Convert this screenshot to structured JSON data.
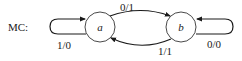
{
  "diagram": {
    "type": "state-machine",
    "title": "MC:",
    "states": [
      {
        "id": "a",
        "label": "a"
      },
      {
        "id": "b",
        "label": "b"
      }
    ],
    "transitions": [
      {
        "from": "a",
        "to": "a",
        "label": "1/0"
      },
      {
        "from": "a",
        "to": "b",
        "label": "0/1"
      },
      {
        "from": "b",
        "to": "a",
        "label": "1/1"
      },
      {
        "from": "b",
        "to": "b",
        "label": "0/0"
      }
    ],
    "colors": {
      "stroke": "#1a1a1a",
      "background": "#ffffff"
    }
  }
}
